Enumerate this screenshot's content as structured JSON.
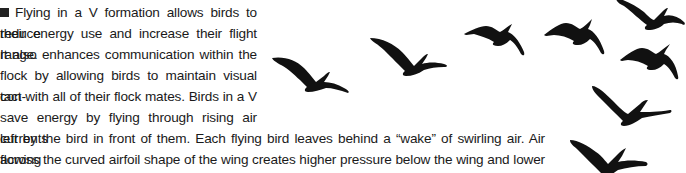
{
  "article": {
    "bullet_icon": "square-bullet",
    "lines": [
      "Flying in a V formation allows birds to reduce",
      "their energy use and increase their flight range.",
      "It also enhances communication within the",
      "flock by allowing birds to maintain visual con-",
      "tact with all of their flock mates. Birds in a V",
      "save energy by flying through rising air currents",
      "left by the bird in front of them. Each flying bird leaves behind a “wake” of swirling air. Air flowing",
      "across the curved airfoil shape of the wing creates higher pressure below the wing and lower pres-",
      "sure above, and this difference in pressure keeps the bird aloft. Most of the wing pushes air down—"
    ]
  },
  "illustration": {
    "subject": "flock of geese flying in V formation",
    "bird_count": 8,
    "color": "#111111"
  }
}
